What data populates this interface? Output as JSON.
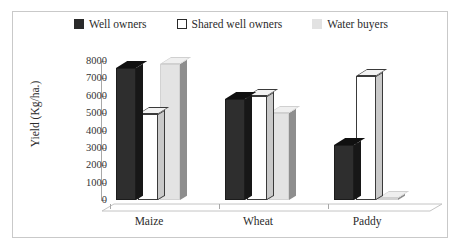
{
  "chart_data": {
    "type": "bar",
    "title": "",
    "subtitle": "",
    "xlabel": "",
    "ylabel": "Yield (Kg/ha.)",
    "categories": [
      "Maize",
      "Wheat",
      "Paddy"
    ],
    "series": [
      {
        "name": "Well owners",
        "swatch": "#2a2a2a",
        "values": [
          7600,
          5800,
          3150
        ]
      },
      {
        "name": "Shared well owners",
        "swatch": "#ffffff",
        "values": [
          4950,
          6000,
          7150
        ]
      },
      {
        "name": "Water buyers",
        "swatch": "#e2e2e2",
        "values": [
          7800,
          5000,
          100
        ]
      }
    ],
    "ylim": [
      0,
      8000
    ],
    "yticks": [
      0,
      1000,
      2000,
      3000,
      4000,
      5000,
      6000,
      7000,
      8000
    ],
    "ytick_labels": [
      "0",
      "1000",
      "2000",
      "3000",
      "4000",
      "5000",
      "6000",
      "7000",
      "8000"
    ],
    "grid": false,
    "legend_position": "top",
    "style": "3d-column",
    "border": true
  },
  "legend": {
    "items": [
      {
        "label": "Well owners"
      },
      {
        "label": "Shared well owners"
      },
      {
        "label": "Water buyers"
      }
    ]
  },
  "axis": {
    "y_title": "Yield (Kg/ha.)"
  }
}
